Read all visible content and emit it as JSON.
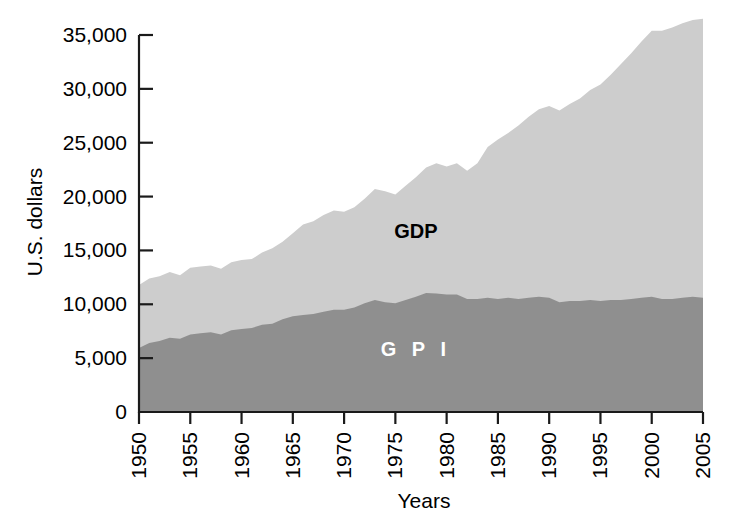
{
  "chart_data": {
    "type": "area",
    "stacked": false,
    "title": "",
    "xlabel": "Years",
    "ylabel": "U.S. dollars",
    "xlim": [
      1950,
      2005
    ],
    "ylim": [
      0,
      36500
    ],
    "yticks": [
      0,
      5000,
      10000,
      15000,
      20000,
      25000,
      30000,
      35000
    ],
    "ytick_labels": [
      "0",
      "5,000",
      "10,000",
      "15,000",
      "20,000",
      "25,000",
      "30,000",
      "35,000"
    ],
    "xticks": [
      1950,
      1955,
      1960,
      1965,
      1970,
      1975,
      1980,
      1985,
      1990,
      1995,
      2000,
      2005
    ],
    "xtick_labels": [
      "1950",
      "1955",
      "1960",
      "1965",
      "1970",
      "1975",
      "1980",
      "1985",
      "1990",
      "1995",
      "2000",
      "2005"
    ],
    "grid": false,
    "legend_position": "inline-annotation",
    "annotations": [
      {
        "text": "GDP",
        "x": 1977,
        "y": 16200,
        "color": "#000000"
      },
      {
        "text": "G P I",
        "x": 1977,
        "y": 5200,
        "color": "#ffffff"
      }
    ],
    "colors": {
      "gdp_fill": "#cdcdcd",
      "gpi_fill": "#8f8f8f",
      "axis": "#1a1a1a",
      "background": "#ffffff"
    },
    "x": [
      1950,
      1951,
      1952,
      1953,
      1954,
      1955,
      1956,
      1957,
      1958,
      1959,
      1960,
      1961,
      1962,
      1963,
      1964,
      1965,
      1966,
      1967,
      1968,
      1969,
      1970,
      1971,
      1972,
      1973,
      1974,
      1975,
      1976,
      1977,
      1978,
      1979,
      1980,
      1981,
      1982,
      1983,
      1984,
      1985,
      1986,
      1987,
      1988,
      1989,
      1990,
      1991,
      1992,
      1993,
      1994,
      1995,
      1996,
      1997,
      1998,
      1999,
      2000,
      2001,
      2002,
      2003,
      2004,
      2005
    ],
    "series": [
      {
        "name": "GDP",
        "values": [
          11800,
          12400,
          12600,
          13000,
          12700,
          13400,
          13500,
          13600,
          13300,
          13900,
          14100,
          14200,
          14800,
          15200,
          15800,
          16600,
          17400,
          17700,
          18300,
          18700,
          18600,
          19000,
          19800,
          20700,
          20500,
          20200,
          21000,
          21800,
          22700,
          23100,
          22800,
          23100,
          22400,
          23100,
          24600,
          25300,
          25900,
          26600,
          27400,
          28100,
          28400,
          28000,
          28600,
          29100,
          29900,
          30400,
          31300,
          32300,
          33300,
          34400,
          35400,
          35400,
          35700,
          36100,
          36400,
          36500
        ]
      },
      {
        "name": "GPI",
        "values": [
          5940,
          6400,
          6600,
          6900,
          6800,
          7200,
          7300,
          7400,
          7200,
          7600,
          7700,
          7800,
          8100,
          8200,
          8600,
          8900,
          9000,
          9100,
          9300,
          9500,
          9500,
          9700,
          10100,
          10400,
          10200,
          10100,
          10400,
          10700,
          11050,
          11000,
          10900,
          10900,
          10500,
          10500,
          10600,
          10500,
          10600,
          10500,
          10600,
          10700,
          10600,
          10200,
          10300,
          10300,
          10400,
          10300,
          10400,
          10400,
          10500,
          10600,
          10700,
          10500,
          10500,
          10600,
          10700,
          10600
        ]
      }
    ]
  },
  "axes": {
    "ylabel": "U.S. dollars",
    "xlabel": "Years"
  },
  "labels": {
    "gdp": "GDP",
    "gpi": "G P I"
  }
}
